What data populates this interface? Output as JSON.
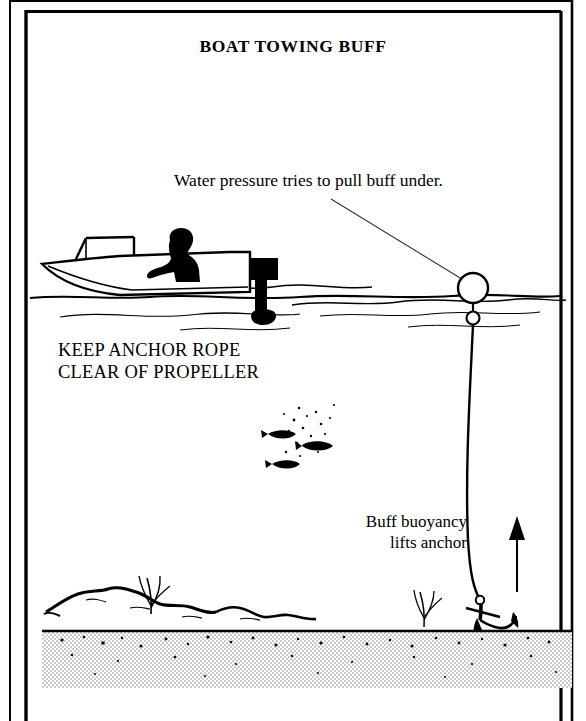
{
  "figure": {
    "title": "BOAT TOWING BUFF",
    "annotations": {
      "surface_note": "Water pressure tries to pull buff under.",
      "warning_line1": "KEEP ANCHOR ROPE",
      "warning_line2": "CLEAR OF PROPELLER",
      "buoyancy_line1": "Buff buoyancy",
      "buoyancy_line2": "lifts anchor"
    },
    "colors": {
      "ink": "#000000",
      "paper": "#ffffff",
      "seabed_fill": "#d8d8d8",
      "line_thin": "#222222"
    },
    "elements": {
      "boat_label": "boat",
      "operator_label": "seated-operator-silhouette",
      "outboard_label": "outboard-motor",
      "buff_label": "buff-float",
      "buff_ring_label": "buff-ring",
      "rope_label": "anchor-rope",
      "anchor_label": "anchor",
      "arrow_label": "lift-arrow",
      "fish_label": "fish-silhouettes",
      "rocks_label": "rocky-outcrop",
      "seabed_label": "seabed",
      "waterline_label": "water-surface"
    }
  }
}
